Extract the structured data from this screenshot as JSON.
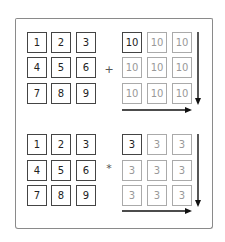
{
  "top": {
    "left_matrix": [
      "1",
      "2",
      "3",
      "4",
      "5",
      "6",
      "7",
      "8",
      "9"
    ],
    "operator": "+",
    "right_matrix": [
      "10",
      "10",
      "10",
      "10",
      "10",
      "10",
      "10",
      "10",
      "10"
    ]
  },
  "bottom": {
    "left_matrix": [
      "1",
      "2",
      "3",
      "4",
      "5",
      "6",
      "7",
      "8",
      "9"
    ],
    "operator": "*",
    "right_matrix": [
      "3",
      "3",
      "3",
      "3",
      "3",
      "3",
      "3",
      "3",
      "3"
    ]
  },
  "icons": {
    "down_arrow": "arrow-down-icon",
    "right_arrow": "arrow-right-icon"
  },
  "colors": {
    "dark": "#444444",
    "light": "#aaaaaa",
    "arrow": "#111111"
  }
}
